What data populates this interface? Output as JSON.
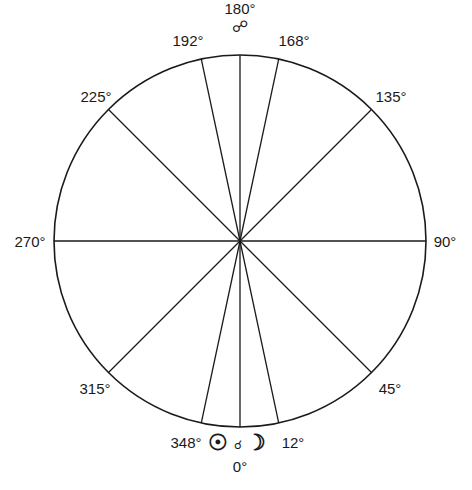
{
  "diagram": {
    "type": "polar angle diagram",
    "center": [
      240,
      241
    ],
    "radius": 186,
    "stroke_color": "#1a1a1a",
    "radial_lines_deg": [
      0,
      12,
      45,
      90,
      135,
      168,
      180,
      192,
      225,
      270,
      315,
      348
    ],
    "labels": [
      {
        "id": "deg-180",
        "text": "180°",
        "x": 240,
        "y": 9
      },
      {
        "id": "deg-192",
        "text": "192°",
        "x": 188,
        "y": 41
      },
      {
        "id": "deg-168",
        "text": "168°",
        "x": 294,
        "y": 41
      },
      {
        "id": "deg-225",
        "text": "225°",
        "x": 96,
        "y": 97
      },
      {
        "id": "deg-135",
        "text": "135°",
        "x": 391,
        "y": 97
      },
      {
        "id": "deg-270",
        "text": "270°",
        "x": 30,
        "y": 242
      },
      {
        "id": "deg-90",
        "text": "90°",
        "x": 445,
        "y": 242
      },
      {
        "id": "deg-315",
        "text": "315°",
        "x": 95,
        "y": 389
      },
      {
        "id": "deg-45",
        "text": "45°",
        "x": 390,
        "y": 389
      },
      {
        "id": "deg-348",
        "text": "348°",
        "x": 186,
        "y": 443
      },
      {
        "id": "deg-12",
        "text": "12°",
        "x": 293,
        "y": 443
      },
      {
        "id": "deg-0",
        "text": "0°",
        "x": 240,
        "y": 467
      }
    ],
    "symbols": {
      "opposition": {
        "glyph": "☍",
        "meaning": "opposition",
        "x": 240,
        "y": 27
      },
      "sun": {
        "glyph": "☉",
        "meaning": "sun",
        "x": 218,
        "y": 443
      },
      "conjunction": {
        "glyph": "☌",
        "meaning": "conjunction",
        "x": 238,
        "y": 445
      },
      "moon": {
        "glyph": "☽",
        "meaning": "moon",
        "x": 256,
        "y": 443
      }
    }
  }
}
